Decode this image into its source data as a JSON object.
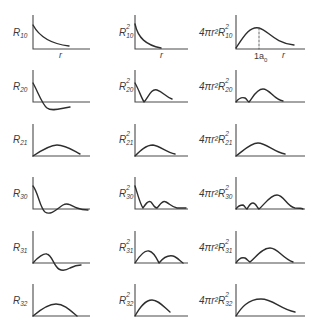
{
  "columns": [
    {
      "key": "R",
      "label_prefix": "R",
      "superscript": ""
    },
    {
      "key": "R2",
      "label_prefix": "R",
      "superscript": "2"
    },
    {
      "key": "P",
      "label_prefix": "4πr²R",
      "superscript": "2"
    }
  ],
  "rows": [
    {
      "nl": "10",
      "labels": {
        "R": "R",
        "R2": "R",
        "P": "4πr²R"
      },
      "sub": "10"
    },
    {
      "nl": "20",
      "labels": {
        "R": "R",
        "R2": "R",
        "P": "4πr²R"
      },
      "sub": "20"
    },
    {
      "nl": "21",
      "labels": {
        "R": "R",
        "R2": "R",
        "P": "4πr²R"
      },
      "sub": "21"
    },
    {
      "nl": "30",
      "labels": {
        "R": "R",
        "R2": "R",
        "P": "4πr²R"
      },
      "sub": "30"
    },
    {
      "nl": "31",
      "labels": {
        "R": "R",
        "R2": "R",
        "P": "4πr²R"
      },
      "sub": "31"
    },
    {
      "nl": "32",
      "labels": {
        "R": "R",
        "R2": "R",
        "P": "4πr²R"
      },
      "sub": "32"
    }
  ],
  "sup2": "2",
  "axis": {
    "x_label": "r",
    "tick_label": "1a",
    "tick_sub": "0"
  },
  "colors": {
    "line": "#2e2e2e",
    "axis": "#4a4a4a",
    "dashed": "#555555"
  }
}
